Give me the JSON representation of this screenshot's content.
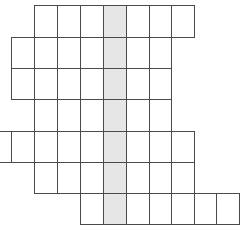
{
  "puzzle": {
    "type": "crossword-grid",
    "highlight_color": "#e6e6e6",
    "line_color": "#4a4a4a",
    "cell_color": "#ffffff",
    "column_edges_px": [
      -12,
      11,
      34,
      57,
      80,
      103,
      126,
      149,
      171,
      194,
      216,
      239
    ],
    "row_edges_px": [
      5,
      37,
      68,
      99,
      131,
      162,
      193,
      224
    ],
    "highlighted_column_index": 5,
    "rows": [
      {
        "row": 0,
        "first_col": 2,
        "last_col": 8
      },
      {
        "row": 1,
        "first_col": 1,
        "last_col": 7
      },
      {
        "row": 2,
        "first_col": 1,
        "last_col": 7
      },
      {
        "row": 3,
        "first_col": 2,
        "last_col": 7
      },
      {
        "row": 4,
        "first_col": 0,
        "last_col": 8
      },
      {
        "row": 5,
        "first_col": 2,
        "last_col": 8
      },
      {
        "row": 6,
        "first_col": 4,
        "last_col": 10
      }
    ]
  }
}
